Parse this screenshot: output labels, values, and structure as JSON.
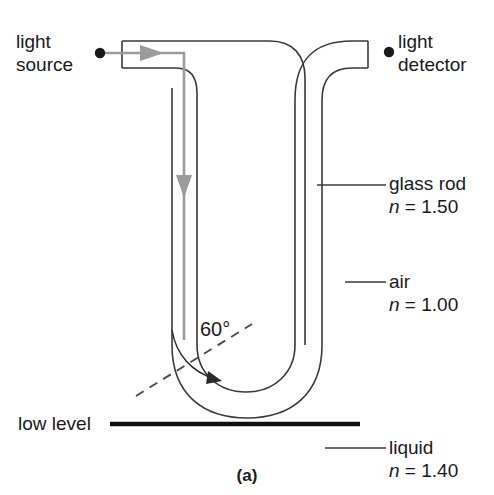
{
  "figure": {
    "caption": "(a)"
  },
  "labels": {
    "light_source": {
      "line1": "light",
      "line2": "source"
    },
    "light_detector": {
      "line1": "light",
      "line2": "detector"
    },
    "glass_rod": {
      "name": "glass rod",
      "index_symbol": "n",
      "index_eq": " = 1.50"
    },
    "air": {
      "name": "air",
      "index_symbol": "n",
      "index_eq": " = 1.00"
    },
    "liquid": {
      "name": "liquid",
      "index_symbol": "n",
      "index_eq": " = 1.40"
    },
    "low_level": {
      "name": "low level"
    },
    "angle": {
      "value": "60°"
    }
  },
  "colors": {
    "outline": "#3a3a3a",
    "ray": "#9b9b9b",
    "text": "#1a1a1a",
    "dot": "#1a1a1a",
    "level_line": "#111111",
    "dashed": "#4a4a4a",
    "background": "#ffffff"
  },
  "diagram_data": {
    "type": "optics-ray-diagram",
    "refractive_indices": {
      "glass_rod": 1.5,
      "air": 1.0,
      "liquid": 1.4
    },
    "incidence_angle_deg": 60,
    "elements": [
      "light-source-dot",
      "glass-rod-outline",
      "ray-path-with-arrows",
      "u-bend",
      "normal-dashed-line",
      "angle-arc",
      "low-level-line",
      "light-detector-dot"
    ]
  }
}
